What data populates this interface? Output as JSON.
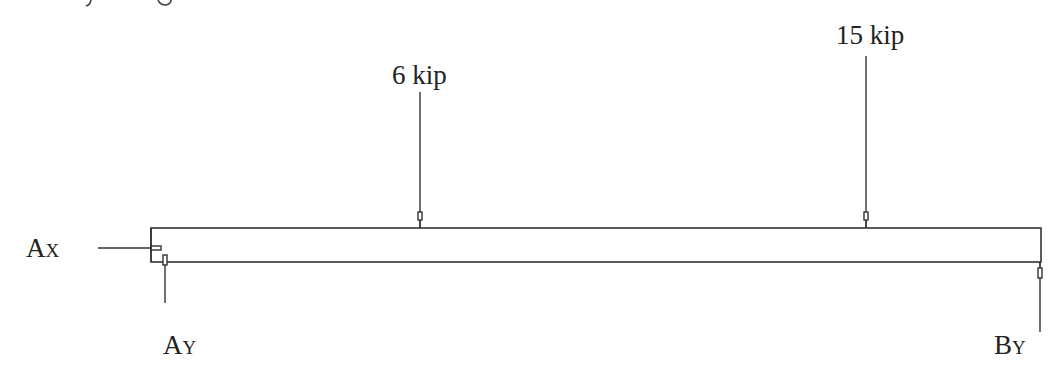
{
  "diagram": {
    "type": "free-body diagram of beam",
    "loads": [
      {
        "label": "6 kip",
        "x": 420
      },
      {
        "label": "15 kip",
        "x": 866
      }
    ],
    "reactions": {
      "ax": {
        "main": "A",
        "sub": "X"
      },
      "ay": {
        "main": "A",
        "sub": "Y"
      },
      "by": {
        "main": "B",
        "sub": "Y"
      }
    },
    "colors": {
      "line": "#333333",
      "text": "#222222",
      "background": "#ffffff"
    }
  }
}
